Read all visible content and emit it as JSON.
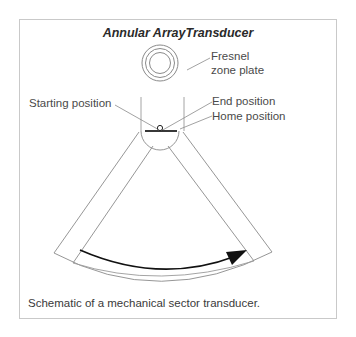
{
  "figure": {
    "title": "Annular ArrayTransducer",
    "labels": {
      "fresnel_line1": "Fresnel",
      "fresnel_line2": "zone plate",
      "starting_position": "Starting position",
      "end_position": "End position",
      "home_position": "Home position"
    },
    "caption": "Schematic of a mechanical sector transducer.",
    "colors": {
      "frame": "#c9c9c9",
      "outline": "#8a8a8a",
      "arrow": "#111111",
      "text": "#4a4a4a"
    }
  }
}
